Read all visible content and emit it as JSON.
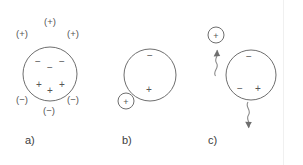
{
  "figure": {
    "width": 303,
    "height": 165,
    "background_color": "#ffffff",
    "stroke_color": "#6e6e6e",
    "text_color": "#4a4a4a"
  },
  "panels": [
    {
      "id": "a",
      "label": "a)",
      "label_x": 25,
      "label_y": 135,
      "sphere": {
        "cx": 50,
        "cy": 74,
        "r": 27
      },
      "external_charges": [
        {
          "text": "(+)",
          "x": 50,
          "y": 22
        },
        {
          "text": "(+)",
          "x": 22,
          "y": 34
        },
        {
          "text": "(+)",
          "x": 73,
          "y": 34
        },
        {
          "text": "(−)",
          "x": 22,
          "y": 100
        },
        {
          "text": "(−)",
          "x": 73,
          "y": 100
        },
        {
          "text": "(−)",
          "x": 49,
          "y": 111
        }
      ],
      "internal_charges": [
        {
          "text": "−",
          "x": 38,
          "y": 62
        },
        {
          "text": "−",
          "x": 62,
          "y": 62
        },
        {
          "text": "−",
          "x": 50,
          "y": 68
        },
        {
          "text": "+",
          "x": 39,
          "y": 85
        },
        {
          "text": "+",
          "x": 62,
          "y": 85
        },
        {
          "text": "+",
          "x": 50,
          "y": 91
        }
      ],
      "satellite": null,
      "arrows": []
    },
    {
      "id": "b",
      "label": "b)",
      "label_x": 122,
      "label_y": 135,
      "sphere": {
        "cx": 150,
        "cy": 75,
        "r": 26
      },
      "external_charges": [],
      "internal_charges": [
        {
          "text": "−",
          "x": 150,
          "y": 56
        },
        {
          "text": "+",
          "x": 149,
          "y": 90
        }
      ],
      "satellite": {
        "cx": 126,
        "cy": 101,
        "r": 8,
        "charge": "+",
        "charge_x": 126,
        "charge_y": 102
      },
      "arrows": []
    },
    {
      "id": "c",
      "label": "c)",
      "label_x": 208,
      "label_y": 135,
      "sphere": {
        "cx": 251,
        "cy": 75,
        "r": 25
      },
      "external_charges": [],
      "internal_charges": [
        {
          "text": "−",
          "x": 249,
          "y": 57
        },
        {
          "text": "−",
          "x": 240,
          "y": 89
        },
        {
          "text": "+",
          "x": 258,
          "y": 89
        }
      ],
      "satellite": {
        "cx": 216,
        "cy": 35,
        "r": 8,
        "charge": "+",
        "charge_x": 216,
        "charge_y": 36
      },
      "arrows": [
        {
          "name": "wavy-arrow-up",
          "direction": "up",
          "x": 216,
          "y_start": 76,
          "y_end": 47
        },
        {
          "name": "wavy-arrow-down",
          "direction": "down",
          "x": 247,
          "y_start": 103,
          "y_end": 133
        }
      ]
    }
  ]
}
